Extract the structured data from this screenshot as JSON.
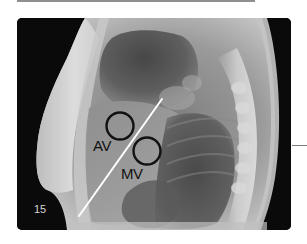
{
  "figure": {
    "number": "15",
    "type": "lateral chest radiograph",
    "annotations": {
      "av_label": "AV",
      "mv_label": "MV",
      "circles": [
        {
          "name": "aortic-valve",
          "cx": 103,
          "cy": 108,
          "r": 13.5
        },
        {
          "name": "mitral-valve",
          "cx": 130,
          "cy": 133,
          "r": 13.5
        }
      ],
      "line": {
        "x1": 145,
        "y1": 81,
        "x2": 62,
        "y2": 198,
        "color": "#ffffff"
      },
      "circle_color": "#121212"
    }
  },
  "colors": {
    "background": "#ffffff",
    "frame": "#0a0a0a",
    "top_bar": "#8f8f8f",
    "leader_line": "#7a7a7a",
    "number_text": "#d6d6d6"
  }
}
